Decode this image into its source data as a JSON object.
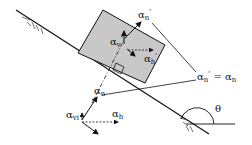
{
  "diagram": {
    "labels": {
      "alpha_n_prime_top": {
        "base": "α",
        "sub": "n",
        "sup": "'"
      },
      "alpha_v_prime": {
        "base": "α",
        "sub": "v",
        "sup": "'"
      },
      "alpha_h_prime": {
        "base": "α",
        "sub": "h",
        "sup": "'"
      },
      "alpha_n": {
        "base": "α",
        "sub": "n"
      },
      "alpha_vi": {
        "base": "α",
        "sub": "vi"
      },
      "alpha_h": {
        "base": "α",
        "sub": "h"
      },
      "equation": {
        "lhs_base": "α",
        "lhs_sub": "n",
        "lhs_sup": "'",
        "eq": " = ",
        "rhs_base": "α",
        "rhs_sub": "n"
      },
      "theta": "θ"
    },
    "colors": {
      "block_fill": "#c8c8c8",
      "line": "#111111",
      "background": "#ffffff"
    }
  }
}
